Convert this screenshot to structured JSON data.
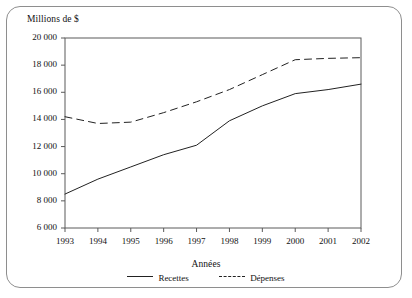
{
  "chart_data": {
    "type": "line",
    "title": "",
    "ylabel": "Millions de $",
    "xlabel": "Années",
    "categories": [
      "1993",
      "1994",
      "1995",
      "1996",
      "1997",
      "1998",
      "1999",
      "2000",
      "2001",
      "2002"
    ],
    "x": [
      1993,
      1994,
      1995,
      1996,
      1997,
      1998,
      1999,
      2000,
      2001,
      2002
    ],
    "ylim": [
      6000,
      20000
    ],
    "yticks": [
      6000,
      8000,
      10000,
      12000,
      14000,
      16000,
      18000,
      20000
    ],
    "ytick_labels": [
      "6 000",
      "8 000",
      "10 000",
      "12 000",
      "14 000",
      "16 000",
      "18 000",
      "20 000"
    ],
    "grid": false,
    "legend_position": "bottom",
    "series": [
      {
        "name": "Recettes",
        "style": "solid",
        "color": "#222222",
        "values": [
          8500,
          9600,
          10500,
          11400,
          12100,
          13900,
          15000,
          15900,
          16200,
          16600
        ]
      },
      {
        "name": "Dépenses",
        "style": "dashed",
        "color": "#222222",
        "values": [
          14200,
          13700,
          13800,
          14500,
          15300,
          16200,
          17300,
          18400,
          18500,
          18550
        ]
      }
    ]
  },
  "legend": {
    "recettes_label": "Recettes",
    "depenses_label": "Dépenses"
  }
}
